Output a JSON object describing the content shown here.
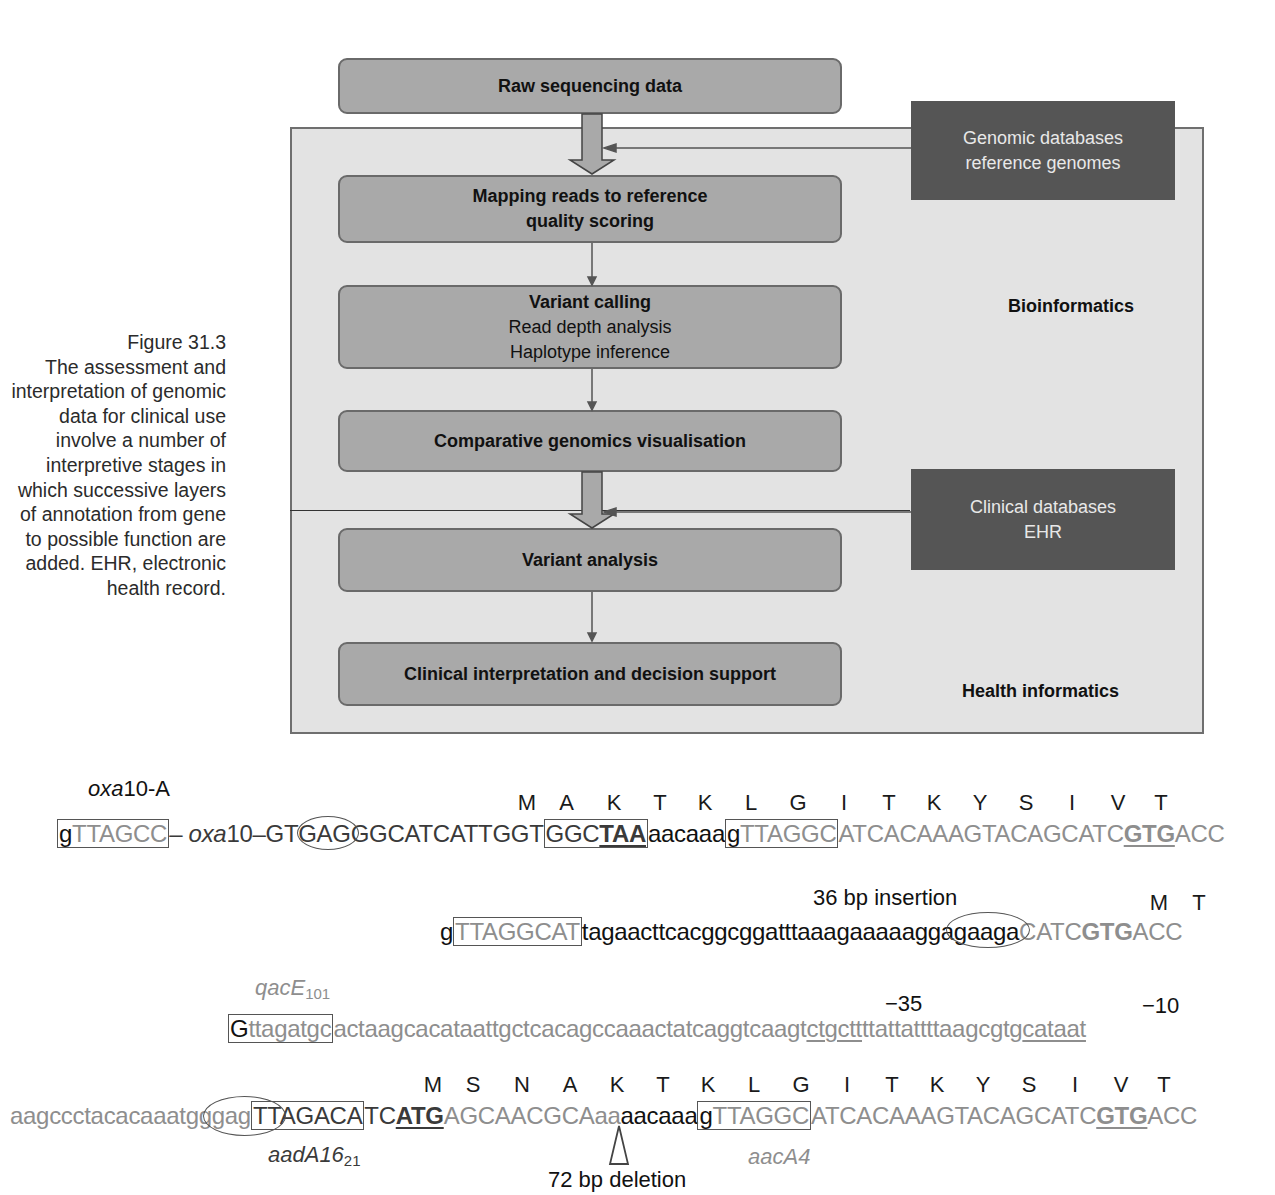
{
  "caption": {
    "figure_number": "Figure 31.3",
    "text": "The assessment and interpretation of genomic data for clinical use involve a number of interpretive stages in which successive layers of annotation from gene to possible function are added. EHR, electronic health record."
  },
  "flowchart": {
    "steps": [
      {
        "title": "Raw sequencing data"
      },
      {
        "title": "Mapping reads to reference",
        "subtitle": "quality scoring"
      },
      {
        "title": "Variant calling",
        "lines": [
          "Read depth analysis",
          "Haplotype inference"
        ]
      },
      {
        "title": "Comparative genomics visualisation"
      },
      {
        "title": "Variant analysis"
      },
      {
        "title": "Clinical interpretation and decision support"
      }
    ],
    "databases": [
      {
        "line1": "Genomic databases",
        "line2": "reference genomes"
      },
      {
        "line1": "Clinical databases",
        "line2": "EHR"
      }
    ],
    "regions": {
      "bioinformatics": "Bioinformatics",
      "health_informatics": "Health informatics"
    },
    "colors": {
      "panel_bg": "#e3e3e3",
      "step_bg": "#a9a9a9",
      "db_bg": "#555555",
      "db_text": "#e8e8e8"
    }
  },
  "sequences": {
    "row1": {
      "label": "oxa10-A",
      "label_italic": "oxa",
      "label_rest": "10-A",
      "amino_acids": [
        "M",
        "A",
        "K",
        "T",
        "K",
        "L",
        "G",
        "I",
        "T",
        "K",
        "Y",
        "S",
        "I",
        "V",
        "T"
      ],
      "parts": {
        "box1_g": "g",
        "box1_rest": "TTAGCC",
        "dash1": "– ",
        "oxa_italic": "oxa",
        "oxa_rest": "10–GT",
        "oval_text": "GAG",
        "mid": "GGCATCATTGGT",
        "box2_a": "GGC",
        "box2_stop": "TAA",
        "lower": "aacaaa",
        "box3_g": "g",
        "box3_rest": "TTAGGC",
        "tail": "ATCACAAAGTACAGCATC",
        "gtg": "GTG",
        "end": "ACC"
      }
    },
    "row2": {
      "annotation": "36 bp insertion",
      "amino_acids": [
        "M",
        "T"
      ],
      "parts": {
        "g": "g",
        "box_text": "TTAGGCAT",
        "insert": "tagaacttcacggcggatttaaagaaaaa",
        "oval_text": "ggagaa",
        "after": "ga",
        "tail": "CATC",
        "gtg": "GTG",
        "end": "ACC"
      }
    },
    "row3": {
      "label_italic": "qacE",
      "label_sub": "101",
      "minus35": "−35",
      "minus10": "−10",
      "parts": {
        "box_G": "G",
        "box_rest": "ttagatgc",
        "mid": "actaagcacataattgctcacagccaaactatcaggtcaagt",
        "m35": "ctgctt",
        "mid2": "ttattattttaagcgtg",
        "m10": "cataat"
      }
    },
    "row4": {
      "label_italic": "aadA16",
      "label_sub": "21",
      "label2": "aacA4",
      "deletion": "72 bp deletion",
      "amino_acids": [
        "M",
        "S",
        "N",
        "A",
        "K",
        "T",
        "K",
        "L",
        "G",
        "I",
        "T",
        "K",
        "Y",
        "S",
        "I",
        "V",
        "T"
      ],
      "parts": {
        "lead": "aagccctacacaaat",
        "oval_text": "gggag",
        "box1": "TTAGACA",
        "tc": "TC",
        "atg": "ATG",
        "cds": "AGCAACGCA",
        "aa": "aa",
        "lower": "aacaaa",
        "box2_g": "g",
        "box2_rest": "TTAGGC",
        "tail": "ATCACAAAGTACAGCATC",
        "gtg": "GTG",
        "end": "ACC"
      }
    }
  }
}
